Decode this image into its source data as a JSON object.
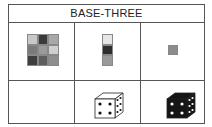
{
  "title": "BASE-THREE",
  "grid": {
    "rows": 2,
    "cols": 3,
    "row1": [
      {
        "name": "3x3-square",
        "colors": [
          "#c8c8c8",
          "#3a3a3a",
          "#a8a8a8",
          "#7a7a7a",
          "#9a9a9a",
          "#cfcfcf",
          "#3e3e3e",
          "#5e5e5e",
          "#8e8e8e"
        ]
      },
      {
        "name": "3x1-column",
        "colors": [
          "#e6e6e6",
          "#2e2e2e",
          "#9a9a9a"
        ]
      },
      {
        "name": "1x1-unit",
        "colors": [
          "#8c8c8c"
        ]
      }
    ],
    "row2": [
      {
        "name": "empty"
      },
      {
        "name": "white-die",
        "front_pips": 4,
        "side_pips": 6,
        "fill": "#ffffff",
        "pip": "#111111"
      },
      {
        "name": "black-die",
        "front_pips": 4,
        "side_pips": 6,
        "fill": "#151515",
        "pip": "#ffffff"
      }
    ]
  }
}
